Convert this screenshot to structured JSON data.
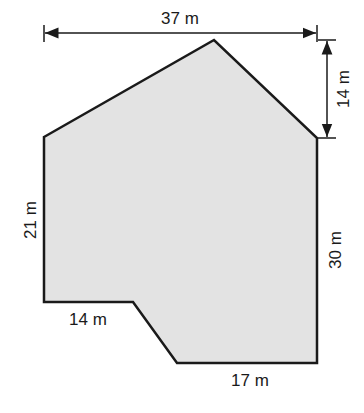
{
  "diagram": {
    "type": "composite-polygon-floor-plan",
    "fill_color": "#e3e3e3",
    "stroke_color": "#1a1a1a",
    "shape": {
      "vertices": [
        [
          44,
          137
        ],
        [
          214,
          40
        ],
        [
          317,
          138
        ],
        [
          317,
          363
        ],
        [
          177,
          363
        ],
        [
          133,
          302
        ],
        [
          44,
          302
        ]
      ]
    },
    "dimensions": {
      "top_width": "37 m",
      "roof_height": "14 m",
      "left_side": "21 m",
      "right_side": "30 m",
      "bottom_left": "14 m",
      "bottom_right": "17 m"
    }
  }
}
